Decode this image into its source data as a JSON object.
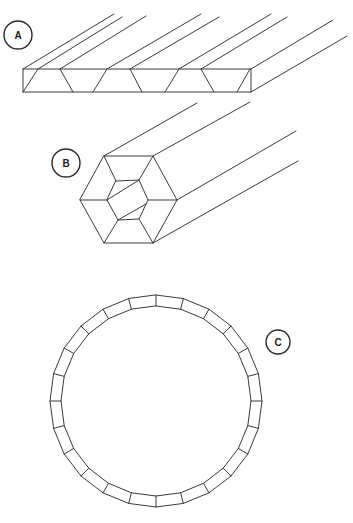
{
  "diagram": {
    "line_color": "#3a3a3a",
    "background": "#ffffff",
    "figures": [
      {
        "id": "A",
        "label": "A",
        "description": "Rectangular slab with trapezoidal cross-section divisions extending into depth",
        "label_pos": [
          18,
          35
        ]
      },
      {
        "id": "B",
        "label": "B",
        "description": "Hexagonal prism with concentric inner hexagon, extending into depth",
        "label_pos": [
          66,
          163
        ]
      },
      {
        "id": "C",
        "label": "C",
        "description": "Ring made of 24 segmented blocks",
        "label_pos": [
          278,
          342
        ],
        "segments": 24
      }
    ]
  }
}
